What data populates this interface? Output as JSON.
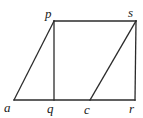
{
  "figure": {
    "type": "geometry-diagram",
    "background_color": "#ffffff",
    "stroke_color": "#2b2b2b",
    "stroke_width": 1.3,
    "canvas": {
      "width": 143,
      "height": 118
    },
    "points": {
      "a": {
        "x": 14,
        "y": 100
      },
      "q": {
        "x": 54,
        "y": 100
      },
      "c": {
        "x": 90,
        "y": 100
      },
      "r": {
        "x": 135,
        "y": 100
      },
      "p": {
        "x": 54,
        "y": 21
      },
      "s": {
        "x": 136,
        "y": 21
      }
    },
    "segments": [
      {
        "name": "base-a-r",
        "from": "a",
        "to": "r"
      },
      {
        "name": "top-p-s",
        "from": "p",
        "to": "s"
      },
      {
        "name": "side-a-p",
        "from": "a",
        "to": "p"
      },
      {
        "name": "side-s-r",
        "from": "s",
        "to": "r"
      },
      {
        "name": "vertical-p-q",
        "from": "p",
        "to": "q"
      },
      {
        "name": "diagonal-c-s",
        "from": "c",
        "to": "s"
      }
    ],
    "labels": [
      {
        "key": "p",
        "text": "p",
        "left": 45,
        "top": 7
      },
      {
        "key": "s",
        "text": "s",
        "left": 128,
        "top": 6
      },
      {
        "key": "a",
        "text": "a",
        "left": 4,
        "top": 101
      },
      {
        "key": "q",
        "text": "q",
        "left": 47,
        "top": 102
      },
      {
        "key": "c",
        "text": "c",
        "left": 84,
        "top": 103
      },
      {
        "key": "r",
        "text": "r",
        "left": 129,
        "top": 102
      }
    ]
  }
}
